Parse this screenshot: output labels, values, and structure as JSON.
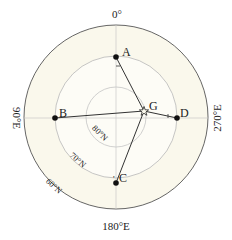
{
  "diagram": {
    "type": "polar-projection-map",
    "colors": {
      "background": "#ffffff",
      "disc_fill": "#faf8ec",
      "outer_circle": "#555555",
      "inner_circles": "#b8b8b8",
      "meridians": "#c8c8c8",
      "lines": "#333333",
      "points": "#111111"
    },
    "longitude_labels": {
      "top": "0°",
      "bottom": "180°E",
      "left": "90°E",
      "right": "270°E"
    },
    "latitude_labels": {
      "lat60": "60°N",
      "lat70": "70°N",
      "lat80": "80°N"
    },
    "points": {
      "A": "A",
      "B": "B",
      "C": "C",
      "D": "D",
      "G": "G"
    },
    "segments": [
      {
        "from": "G",
        "to": "A"
      },
      {
        "from": "G",
        "to": "B"
      },
      {
        "from": "G",
        "to": "C"
      },
      {
        "from": "G",
        "to": "D"
      }
    ]
  }
}
